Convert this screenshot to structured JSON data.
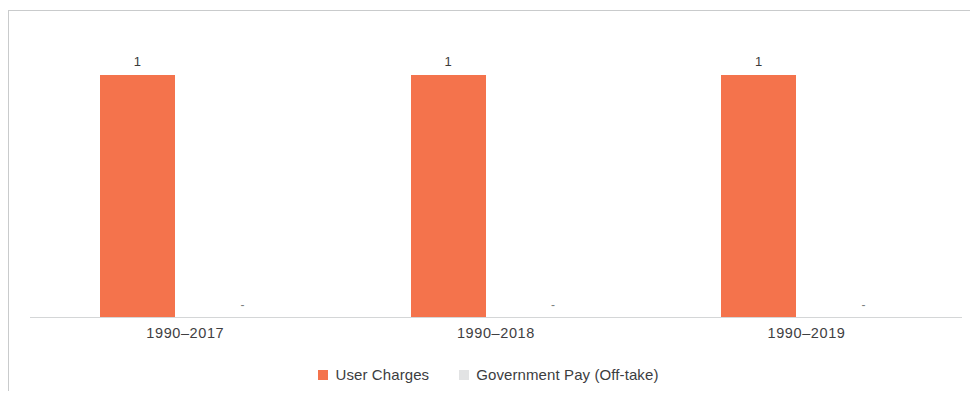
{
  "chart_data": {
    "type": "bar",
    "title": "",
    "subtitle": "",
    "xlabel": "",
    "ylabel": "",
    "categories": [
      "1990–2017",
      "1990–2018",
      "1990–2019"
    ],
    "series": [
      {
        "name": "User Charges",
        "color": "#f4734c",
        "values": [
          1,
          1,
          1
        ],
        "value_labels": [
          "1",
          "1",
          "1"
        ]
      },
      {
        "name": "Government Pay (Off-take)",
        "color": "#e2e3e4",
        "values": [
          0,
          0,
          0
        ],
        "value_labels": [
          "-",
          "-",
          "-"
        ]
      }
    ],
    "ylim": [
      0,
      1.22
    ],
    "grid": false,
    "y_axis_visible": false,
    "legend_position": "bottom",
    "data_labels_shown": true
  },
  "legend": {
    "items": [
      {
        "label": "User Charges",
        "color": "#f4734c"
      },
      {
        "label": "Government Pay (Off-take)",
        "color": "#e2e3e4"
      }
    ]
  },
  "colors": {
    "series_user_charges": "#f4734c",
    "series_government_pay": "#e2e3e4",
    "frame_border": "#c9cbcc",
    "axis_line": "#d4d6d7",
    "label_text": "#3c3d3f",
    "background": "#ffffff"
  }
}
